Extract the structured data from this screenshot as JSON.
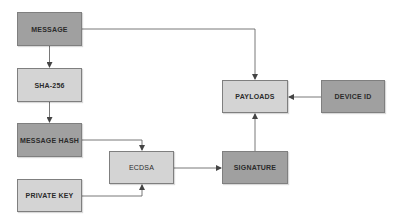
{
  "diagram": {
    "title": "",
    "colors": {
      "dark_node": "#a0a0a0",
      "light_node": "#d4d4d4",
      "edge": "#555555",
      "background": "#ffffff"
    },
    "nodes": {
      "message": {
        "label": "MESSAGE",
        "style": "dark"
      },
      "sha256": {
        "label": "SHA-256",
        "style": "light"
      },
      "message_hash": {
        "label": "MESSAGE HASH",
        "style": "dark"
      },
      "private_key": {
        "label": "PRIVATE KEY",
        "style": "light"
      },
      "ecdsa": {
        "label": "ECDSA",
        "style": "light"
      },
      "signature": {
        "label": "SIGNATURE",
        "style": "dark"
      },
      "payloads": {
        "label": "PAYLOADS",
        "style": "light"
      },
      "device_id": {
        "label": "DEVICE ID",
        "style": "dark"
      }
    },
    "edges": [
      {
        "from": "MESSAGE",
        "to": "SHA-256"
      },
      {
        "from": "SHA-256",
        "to": "MESSAGE HASH"
      },
      {
        "from": "MESSAGE HASH",
        "to": "ECDSA"
      },
      {
        "from": "PRIVATE KEY",
        "to": "ECDSA"
      },
      {
        "from": "ECDSA",
        "to": "SIGNATURE"
      },
      {
        "from": "SIGNATURE",
        "to": "PAYLOADS"
      },
      {
        "from": "DEVICE ID",
        "to": "PAYLOADS"
      },
      {
        "from": "MESSAGE",
        "to": "PAYLOADS"
      }
    ]
  }
}
